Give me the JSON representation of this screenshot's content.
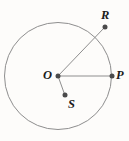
{
  "figure": {
    "type": "circle-with-radii-diagram",
    "canvas": {
      "width": 129,
      "height": 141
    },
    "background_color": "#fdfcfa",
    "stroke_color": "#8a8a8a",
    "segment_color": "#8a8a8a",
    "point_color": "#4a4a4a",
    "label_color": "#1b1b1b",
    "circle": {
      "name": "circle-O",
      "center": {
        "x": 58,
        "y": 76
      },
      "radius": 54,
      "stroke_width": 1
    },
    "points": [
      {
        "id": "O",
        "label": "O",
        "x": 58,
        "y": 76,
        "position": "center",
        "label_side": "left"
      },
      {
        "id": "P",
        "label": "P",
        "x": 112,
        "y": 76,
        "position": "on-circle",
        "label_side": "right"
      },
      {
        "id": "R",
        "label": "R",
        "x": 105,
        "y": 27,
        "position": "outside-circle",
        "label_side": "above"
      },
      {
        "id": "S",
        "label": "S",
        "x": 65,
        "y": 95,
        "position": "inside-circle",
        "label_side": "below-right"
      }
    ],
    "segments": [
      {
        "id": "OR",
        "from": "O",
        "to": "R",
        "from_x": 58,
        "from_y": 76,
        "to_x": 105,
        "to_y": 27
      },
      {
        "id": "OP",
        "from": "O",
        "to": "P",
        "from_x": 58,
        "from_y": 76,
        "to_x": 112,
        "to_y": 76
      },
      {
        "id": "OS",
        "from": "O",
        "to": "S",
        "from_x": 58,
        "from_y": 76,
        "to_x": 65,
        "to_y": 95
      }
    ],
    "labels": {
      "O": "O",
      "P": "P",
      "R": "R",
      "S": "S"
    }
  }
}
